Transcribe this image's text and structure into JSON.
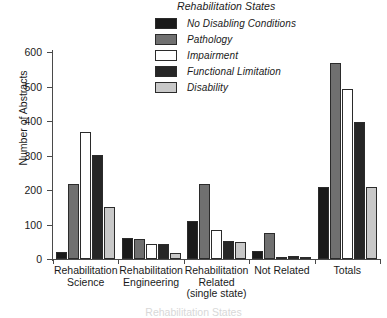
{
  "chart_data": {
    "type": "bar",
    "title": "Rehabilitation States",
    "xlabel": "Rehabilitation States",
    "ylabel": "Number of Abstracts",
    "ylim": [
      0,
      600
    ],
    "yticks": [
      0,
      100,
      200,
      300,
      400,
      500,
      600
    ],
    "grid": false,
    "legend_position": "top-right",
    "categories": [
      "Rehabilitation Science",
      "Rehabilitation Engineering",
      "Rehabilitation Related (single state)",
      "Not Related",
      "Totals"
    ],
    "series": [
      {
        "name": "No Disabling Conditions",
        "color": "#1a1a1a",
        "values": [
          20,
          60,
          110,
          22,
          210
        ]
      },
      {
        "name": "Pathology",
        "color": "#707070",
        "values": [
          218,
          58,
          218,
          75,
          568
        ]
      },
      {
        "name": "Impairment",
        "color": "#ffffff",
        "values": [
          368,
          43,
          85,
          3,
          492
        ]
      },
      {
        "name": "Functional Limitation",
        "color": "#262626",
        "values": [
          302,
          43,
          52,
          8,
          396
        ]
      },
      {
        "name": "Disability",
        "color": "#c8c8c8",
        "values": [
          152,
          18,
          48,
          2,
          210
        ]
      }
    ]
  },
  "legend": {
    "title": "Rehabilitation States",
    "items": [
      {
        "label": "No Disabling Conditions",
        "swatch": "#1a1a1a"
      },
      {
        "label": "Pathology",
        "swatch": "#707070"
      },
      {
        "label": "Impairment",
        "swatch": "#ffffff"
      },
      {
        "label": "Functional Limitation",
        "swatch": "#262626"
      },
      {
        "label": "Disability",
        "swatch": "#c8c8c8"
      }
    ]
  },
  "axes": {
    "y_title": "Number of Abstracts",
    "y_tick_labels": [
      "600",
      "500",
      "400",
      "300",
      "200",
      "100",
      "0"
    ],
    "x_title": "Rehabilitation States",
    "x_tick_labels": [
      [
        "Rehabilitation",
        "Science"
      ],
      [
        "Rehabilitation",
        "Engineering"
      ],
      [
        "Rehabilitation",
        "Related",
        "(single state)"
      ],
      [
        "Not Related"
      ],
      [
        "Totals"
      ]
    ]
  }
}
